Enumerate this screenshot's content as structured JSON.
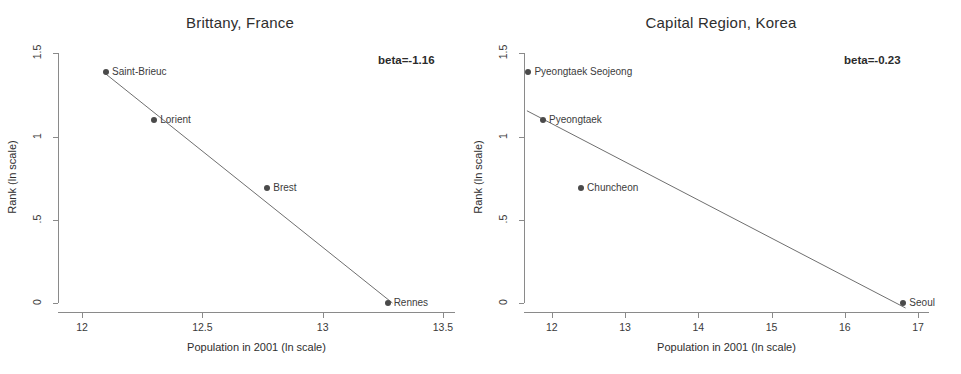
{
  "figure": {
    "width": 961,
    "height": 374,
    "background": "#ffffff",
    "point_color": "#4a4a4a",
    "line_color": "#6f6f6f",
    "axis_color": "#8a8a8a",
    "text_color": "#3a3a3a"
  },
  "chart_data": [
    {
      "type": "scatter",
      "panel": "left",
      "title": "Brittany, France",
      "xlabel": "Population in 2001 (ln scale)",
      "ylabel": "Rank (ln scale)",
      "xlim": [
        11.9,
        13.55
      ],
      "ylim": [
        -0.06,
        1.55
      ],
      "xticks": [
        12,
        12.5,
        13,
        13.5
      ],
      "xticklabels": [
        "12",
        "12.5",
        "13",
        "13.5"
      ],
      "yticks": [
        0,
        0.5,
        1,
        1.5
      ],
      "yticklabels": [
        "0",
        ".5",
        "1",
        "1.5"
      ],
      "grid": false,
      "legend": "none",
      "annotation": "beta=-1.16",
      "beta": -1.16,
      "points": [
        {
          "label": "Saint-Brieuc",
          "x": 12.1,
          "y": 1.386
        },
        {
          "label": "Lorient",
          "x": 12.3,
          "y": 1.099
        },
        {
          "label": "Brest",
          "x": 12.77,
          "y": 0.693
        },
        {
          "label": "Rennes",
          "x": 13.27,
          "y": 0.0
        }
      ],
      "fitline": {
        "x0": 12.09,
        "y0": 1.386,
        "x1": 13.29,
        "y1": 0.0
      }
    },
    {
      "type": "scatter",
      "panel": "right",
      "title": "Capital Region, Korea",
      "xlabel": "Population in 2001 (ln scale)",
      "ylabel": "Rank (ln scale)",
      "xlim": [
        11.62,
        17.15
      ],
      "ylim": [
        -0.06,
        1.55
      ],
      "xticks": [
        12,
        13,
        14,
        15,
        16,
        17
      ],
      "xticklabels": [
        "12",
        "13",
        "14",
        "15",
        "16",
        "17"
      ],
      "yticks": [
        0,
        0.5,
        1,
        1.5
      ],
      "yticklabels": [
        "0",
        ".5",
        "1",
        "1.5"
      ],
      "grid": false,
      "legend": "none",
      "annotation": "beta=-0.23",
      "beta": -0.23,
      "points": [
        {
          "label": "Pyeongtaek Seojeong",
          "x": 11.68,
          "y": 1.386
        },
        {
          "label": "Pyeongtaek",
          "x": 11.88,
          "y": 1.099
        },
        {
          "label": "Chuncheon",
          "x": 12.4,
          "y": 0.693
        },
        {
          "label": "Seoul",
          "x": 16.8,
          "y": 0.0
        }
      ],
      "fitline": {
        "x0": 11.66,
        "y0": 1.155,
        "x1": 16.83,
        "y1": -0.03
      }
    }
  ]
}
